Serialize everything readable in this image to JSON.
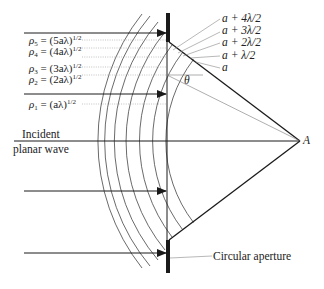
{
  "figure": {
    "left_labels": [
      {
        "id": "rho5",
        "rho": "ρ",
        "sub": "5",
        "rhs": " = (5aλ)",
        "sup": "1/2"
      },
      {
        "id": "rho4",
        "rho": "ρ",
        "sub": "4",
        "rhs": " = (4aλ)",
        "sup": "1/2"
      },
      {
        "id": "rho3",
        "rho": "ρ",
        "sub": "3",
        "rhs": " = (3aλ)",
        "sup": "1/2"
      },
      {
        "id": "rho2",
        "rho": "ρ",
        "sub": "2",
        "rhs": " = (2aλ)",
        "sup": "1/2"
      },
      {
        "id": "rho1",
        "rho": "ρ",
        "sub": "1",
        "rhs": " = (aλ)",
        "sup": "1/2"
      }
    ],
    "right_labels": [
      "a + 4λ/2",
      "a + 3λ/2",
      "a + 2λ/2",
      "a + λ/2",
      "a"
    ],
    "incident_label_line1": "Incident",
    "incident_label_line2": "planar wave",
    "angle_label": "θ",
    "point_label": "A",
    "aperture_label": "Circular aperture"
  },
  "colors": {
    "line": "#1a1a1a",
    "thin_line": "#555555",
    "dotted": "#9a9a9a",
    "text": "#222222"
  }
}
